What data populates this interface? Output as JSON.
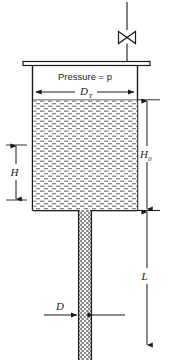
{
  "figure": {
    "type": "engineering-schematic",
    "background_color": "#ffffff",
    "line_color": "#1a1a1a",
    "liquid_fill_color": "#e8e8e8"
  },
  "labels": {
    "pressure": "Pressure = p",
    "tank_diameter": "D",
    "tank_diameter_subscript": "T",
    "liquid_height_initial": "H",
    "liquid_height_initial_subscript": "0",
    "liquid_height": "H",
    "pipe_diameter": "D",
    "pipe_length": "L"
  },
  "components": {
    "valve": "valve-symbol",
    "inlet_line": "pressure-supply-line",
    "tank_lid": "tank-top-plate",
    "tank": "storage-tank",
    "liquid": "liquid-body",
    "pipe": "discharge-pipe"
  },
  "dimensions": {
    "tank_diameter_line": "horizontal-double-arrow",
    "H0_line": "vertical-double-arrow",
    "H_line": "vertical-double-arrow",
    "D_line": "horizontal-inward-arrows",
    "L_line": "vertical-double-arrow"
  }
}
